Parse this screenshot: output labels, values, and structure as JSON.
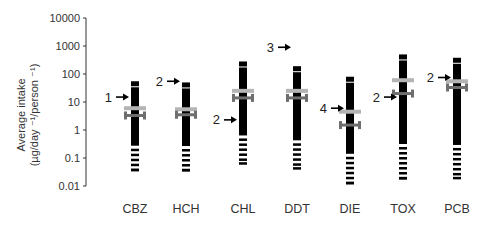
{
  "chart_data": {
    "type": "range-bar (log scale)",
    "title": "",
    "xlabel": "",
    "ylabel": "Average intake (µg/day -1/person -1)",
    "ylabel_line1": "Average intake",
    "ylabel_line2": "(µg/day ⁻¹/person ⁻¹)",
    "yscale": "log",
    "ylim": [
      0.01,
      10000
    ],
    "yticks": [
      "10000",
      "1000",
      "100",
      "10",
      "1",
      "0.1",
      "0.01"
    ],
    "grid": false,
    "categories": [
      "CBZ",
      "HCH",
      "CHL",
      "DDT",
      "DIE",
      "TOX",
      "PCB"
    ],
    "series": [
      {
        "name": "range_max",
        "values": [
          55,
          50,
          280,
          190,
          80,
          500,
          380
        ]
      },
      {
        "name": "range_min",
        "values": [
          0.035,
          0.035,
          0.06,
          0.04,
          0.012,
          0.018,
          0.018
        ]
      },
      {
        "name": "mean (light bar)",
        "values": [
          6,
          5.5,
          25,
          25,
          4.5,
          60,
          55
        ]
      },
      {
        "name": "median (dark bracket)",
        "values": [
          3.3,
          3.5,
          14,
          14,
          1.5,
          20,
          33
        ]
      }
    ],
    "annotations": [
      {
        "category": "CBZ",
        "label": "1",
        "value": 15,
        "side": "left"
      },
      {
        "category": "HCH",
        "label": "2",
        "value": 55,
        "side": "left"
      },
      {
        "category": "CHL",
        "label": "2",
        "value": 2.3,
        "side": "left"
      },
      {
        "category": "DDT",
        "label": "3",
        "value": 900,
        "side": "left"
      },
      {
        "category": "DIE",
        "label": "4",
        "value": 6,
        "side": "left"
      },
      {
        "category": "TOX",
        "label": "2",
        "value": 15,
        "side": "left"
      },
      {
        "category": "PCB",
        "label": "2",
        "value": 75,
        "side": "left"
      }
    ],
    "colors": {
      "range_bar": "#000000",
      "mean_bar": "#b4b4b4",
      "median_bracket": "#6e6e6e",
      "axis": "#333333",
      "text": "#333333"
    }
  }
}
